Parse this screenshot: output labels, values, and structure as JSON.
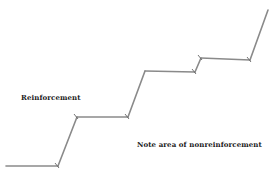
{
  "diagram": {
    "type": "cumulative-record",
    "labels": {
      "reinforcement": "Reinforcement",
      "nonreinforcement_note": "Note area of nonreinforcement"
    },
    "colors": {
      "line": "#8a8a8a",
      "tick": "#666666",
      "text": "#222222"
    },
    "segments": [
      {
        "kind": "pause"
      },
      {
        "kind": "responding",
        "reinforced_at_end": true
      },
      {
        "kind": "pause"
      },
      {
        "kind": "responding",
        "reinforced_at_end": true
      },
      {
        "kind": "pause"
      },
      {
        "kind": "responding",
        "reinforced_at_end": true
      },
      {
        "kind": "pause"
      },
      {
        "kind": "responding",
        "reinforced_at_end": false
      }
    ],
    "reinforcement_marks": 7
  }
}
